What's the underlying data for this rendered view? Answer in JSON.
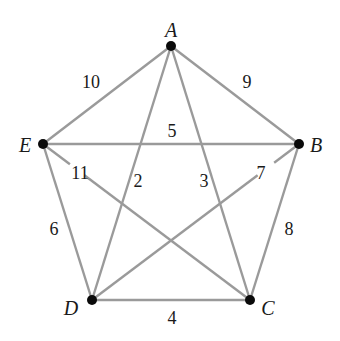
{
  "colors": {
    "edge": "#9a9a9a",
    "node": "#0a0a0a",
    "text": "#1a1a1a",
    "background": "#ffffff"
  },
  "vertices": [
    {
      "id": "A",
      "label": "A",
      "x": 171,
      "y": 46,
      "label_x": 171,
      "label_y": 30
    },
    {
      "id": "B",
      "label": "B",
      "x": 299,
      "y": 144,
      "label_x": 316,
      "label_y": 145
    },
    {
      "id": "C",
      "label": "C",
      "x": 250,
      "y": 300,
      "label_x": 268,
      "label_y": 308
    },
    {
      "id": "D",
      "label": "D",
      "x": 92,
      "y": 300,
      "label_x": 71,
      "label_y": 308
    },
    {
      "id": "E",
      "label": "E",
      "x": 43,
      "y": 144,
      "label_x": 25,
      "label_y": 145
    }
  ],
  "edges": [
    {
      "from": "A",
      "to": "E",
      "weight": "10",
      "label_x": 91,
      "label_y": 82
    },
    {
      "from": "A",
      "to": "B",
      "weight": "9",
      "label_x": 247,
      "label_y": 82
    },
    {
      "from": "E",
      "to": "B",
      "weight": "5",
      "label_x": 172,
      "label_y": 131
    },
    {
      "from": "A",
      "to": "D",
      "weight": "2",
      "label_x": 138,
      "label_y": 181
    },
    {
      "from": "A",
      "to": "C",
      "weight": "3",
      "label_x": 204,
      "label_y": 181
    },
    {
      "from": "E",
      "to": "C",
      "weight": "11",
      "label_x": 80,
      "label_y": 173,
      "gap": [
        0.13,
        0.2
      ]
    },
    {
      "from": "B",
      "to": "D",
      "weight": "7",
      "label_x": 261,
      "label_y": 173,
      "gap": [
        0.12,
        0.2
      ]
    },
    {
      "from": "E",
      "to": "D",
      "weight": "6",
      "label_x": 54,
      "label_y": 229
    },
    {
      "from": "B",
      "to": "C",
      "weight": "8",
      "label_x": 289,
      "label_y": 229
    },
    {
      "from": "D",
      "to": "C",
      "weight": "4",
      "label_x": 172,
      "label_y": 318
    }
  ]
}
